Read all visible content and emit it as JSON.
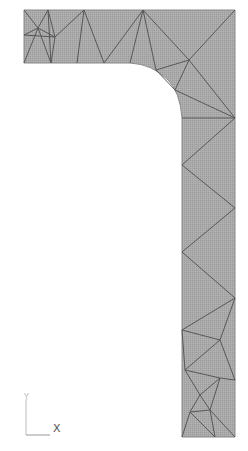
{
  "diagram": {
    "type": "finite-element-mesh",
    "fill_color": "#a8a8a8",
    "edge_color": "#555555"
  },
  "axes": {
    "x_label": "X",
    "y_label": "Y"
  }
}
